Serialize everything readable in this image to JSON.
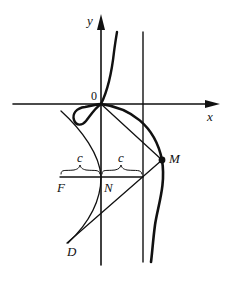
{
  "diagram": {
    "type": "geometric construction (curve with loop, axes, tangent construction)",
    "labels": {
      "y_axis": "y",
      "x_axis": "x",
      "origin": "0",
      "point_M": "M",
      "point_N": "N",
      "point_F": "F",
      "point_D": "D",
      "segment_left": "c",
      "segment_right": "c"
    },
    "colors": {
      "ink": "#111111",
      "background": "#ffffff"
    }
  }
}
